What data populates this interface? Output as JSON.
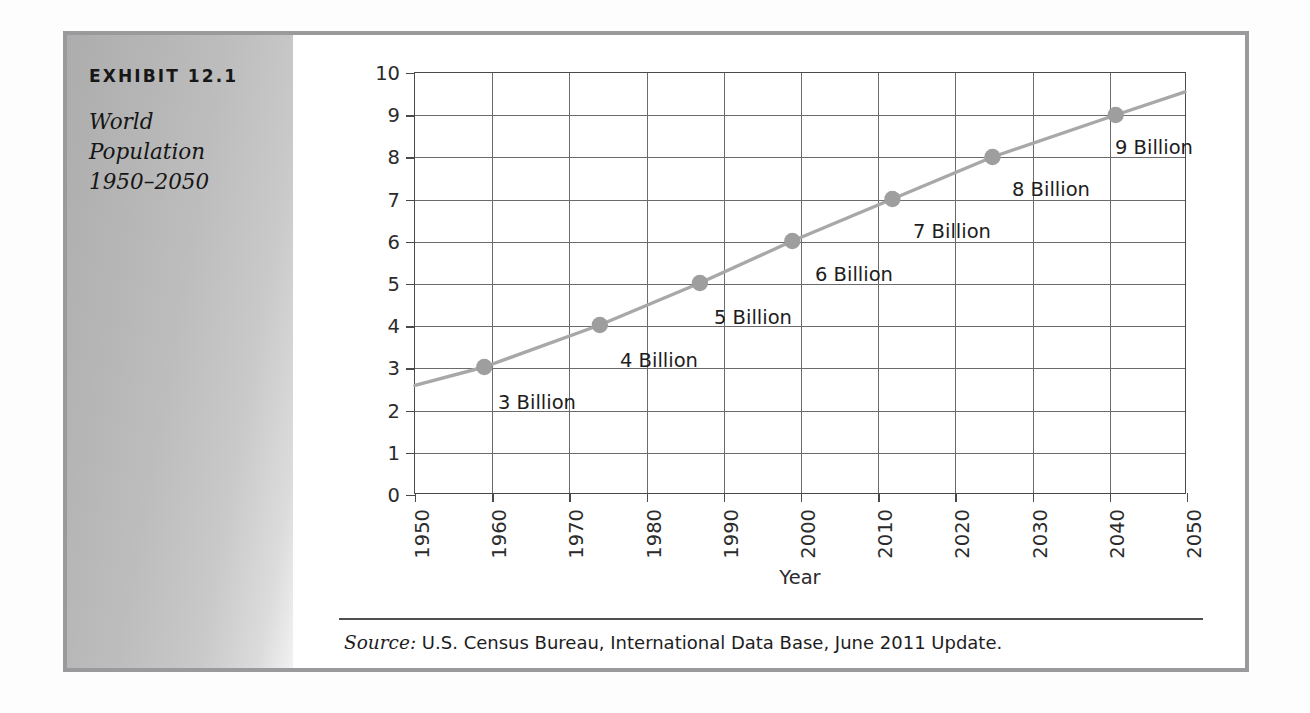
{
  "exhibit": {
    "number": "EXHIBIT 12.1",
    "title_lines": [
      "World",
      "Population",
      "1950–2050"
    ]
  },
  "source": {
    "label": "Source:",
    "text": "U.S. Census Bureau, International Data Base, June 2011 Update."
  },
  "colors": {
    "frame": "#9a9a9c",
    "panel_dark": "#adadad",
    "panel_light": "#f2f2f2",
    "grid": "#6b6b6b",
    "axis": "#4a4a4a",
    "series": "#a8a8a8",
    "marker": "#9e9e9e",
    "text": "#1d1d1d"
  },
  "chart_data": {
    "type": "line",
    "title": "World Population 1950–2050",
    "xlabel": "Year",
    "ylabel": "Population (billions)",
    "xlim": [
      1950,
      2050
    ],
    "ylim": [
      0,
      10
    ],
    "grid": true,
    "legend": "none",
    "xticks": [
      "1950",
      "1960",
      "1970",
      "1980",
      "1990",
      "2000",
      "2010",
      "2020",
      "2030",
      "2040",
      "2050"
    ],
    "yticks": [
      "0",
      "1",
      "2",
      "3",
      "4",
      "5",
      "6",
      "7",
      "8",
      "9",
      "10"
    ],
    "series": [
      {
        "name": "World population",
        "x": [
          1950,
          1959,
          1974,
          1987,
          1999,
          2012,
          2025,
          2041,
          2050
        ],
        "y": [
          2.56,
          3.0,
          4.0,
          5.0,
          6.0,
          7.0,
          8.0,
          9.0,
          9.55
        ]
      }
    ],
    "markers": [
      {
        "x": 1959,
        "y": 3,
        "label": "3 Billion"
      },
      {
        "x": 1974,
        "y": 4,
        "label": "4 Billion"
      },
      {
        "x": 1987,
        "y": 5,
        "label": "5 Billion"
      },
      {
        "x": 1999,
        "y": 6,
        "label": "6 Billion"
      },
      {
        "x": 2012,
        "y": 7,
        "label": "7 Billion"
      },
      {
        "x": 2025,
        "y": 8,
        "label": "8 Billion"
      },
      {
        "x": 2041,
        "y": 9,
        "label": "9 Billion"
      }
    ],
    "annotations": [
      {
        "text": "3 Billion",
        "left": 83,
        "top": 318
      },
      {
        "text": "4 Billion",
        "left": 205,
        "top": 276
      },
      {
        "text": "5 Billion",
        "left": 299,
        "top": 233
      },
      {
        "text": "6 Billion",
        "left": 400,
        "top": 190
      },
      {
        "text": "7 Billion",
        "left": 498,
        "top": 147
      },
      {
        "text": "8 Billion",
        "left": 597,
        "top": 105
      },
      {
        "text": "9 Billion",
        "left": 700,
        "top": 63
      }
    ]
  }
}
